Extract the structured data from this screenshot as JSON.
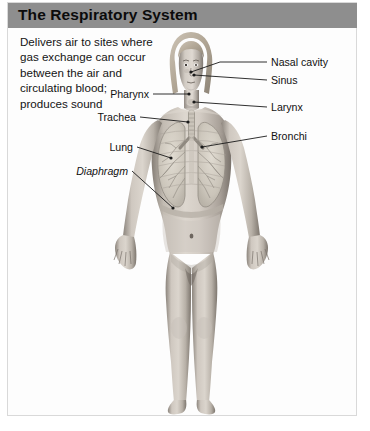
{
  "figure": {
    "title": "The Respiratory System",
    "description_lines": [
      "Delivers air to sites where",
      "gas exchange can occur",
      "between the air and",
      "circulating blood;",
      "produces sound"
    ],
    "description_text": "Delivers air to sites where gas exchange can occur between the air and circulating blood; produces sound"
  },
  "colors": {
    "title_band": "#8e8e8e",
    "title_text": "#0b0b0b",
    "card_background": "#fdfdfd",
    "card_border": "#d9d9d9",
    "page_background": "#ffffff",
    "label_text": "#111111",
    "leader_line": "#1a1a1a",
    "skin_light": "#d8d2cb",
    "skin_mid": "#a79f97",
    "skin_dark": "#6f6861",
    "hair": "#bdb3a4",
    "lung_tissue": "#cfcabf",
    "airway": "#8f8b82"
  },
  "labels": {
    "right": [
      {
        "name": "nasal-cavity",
        "text": "Nasal cavity"
      },
      {
        "name": "sinus",
        "text": "Sinus"
      },
      {
        "name": "larynx",
        "text": "Larynx"
      },
      {
        "name": "bronchi",
        "text": "Bronchi"
      }
    ],
    "left": [
      {
        "name": "pharynx",
        "text": "Pharynx",
        "italic": false
      },
      {
        "name": "trachea",
        "text": "Trachea",
        "italic": false
      },
      {
        "name": "lung",
        "text": "Lung",
        "italic": false
      },
      {
        "name": "diaphragm",
        "text": "Diaphragm",
        "italic": true
      }
    ]
  },
  "illustration": {
    "subject": "standing adult female figure, anterior view, grayscale anatomical render",
    "visible_structures": [
      "nasal cavity",
      "sinus",
      "pharynx",
      "larynx",
      "trachea",
      "bronchi",
      "lungs",
      "diaphragm",
      "rib cage"
    ]
  }
}
